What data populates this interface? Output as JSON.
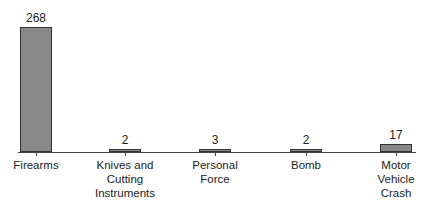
{
  "chart_data": {
    "type": "bar",
    "title": "",
    "xlabel": "",
    "ylabel": "",
    "categories": [
      "Firearms",
      "Knives and Cutting Instruments",
      "Personal Force",
      "Bomb",
      "Motor Vehicle Crash"
    ],
    "category_lines": [
      [
        "Firearms"
      ],
      [
        "Knives and",
        "Cutting",
        "Instruments"
      ],
      [
        "Personal",
        "Force"
      ],
      [
        "Bomb"
      ],
      [
        "Motor",
        "Vehicle",
        "Crash"
      ]
    ],
    "values": [
      268,
      2,
      3,
      2,
      17
    ],
    "value_labels": [
      "268",
      "2",
      "3",
      "2",
      "17"
    ],
    "ylim": [
      0,
      268
    ],
    "grid": false,
    "legend": "none"
  }
}
